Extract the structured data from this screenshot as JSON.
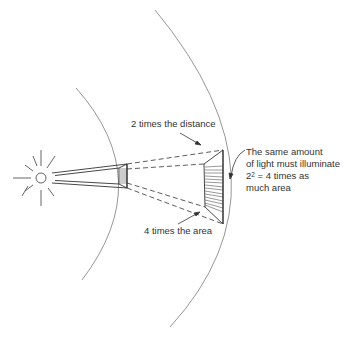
{
  "diagram": {
    "labels": {
      "distance": "2 times the distance",
      "area": "4 times the area",
      "note_line1": "The same amount",
      "note_line2": "of light must illuminate",
      "note_line3_base": "2",
      "note_line3_exp": "2",
      "note_line3_rest": " = 4 times as",
      "note_line4": "much area"
    },
    "elements": {
      "source": "sun-icon",
      "near_surface": "small-illuminated-area",
      "far_surface": "large-illuminated-area"
    },
    "colors": {
      "line": "#333333",
      "arc": "#8a8a8a",
      "background": "#ffffff"
    }
  }
}
